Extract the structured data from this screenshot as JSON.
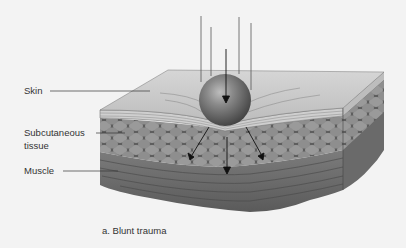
{
  "figure": {
    "caption": "a. Blunt trauma",
    "labels": {
      "skin": "Skin",
      "subcutaneous_line1": "Subcutaneous",
      "subcutaneous_line2": "tissue",
      "muscle": "Muscle"
    },
    "colors": {
      "background": "#f3f3f3",
      "skin_top": "#c9c9c9",
      "fat": "#8a8a8a",
      "muscle": "#6e6e6e",
      "sphere": "#7a7a7a",
      "line": "#333333"
    }
  }
}
